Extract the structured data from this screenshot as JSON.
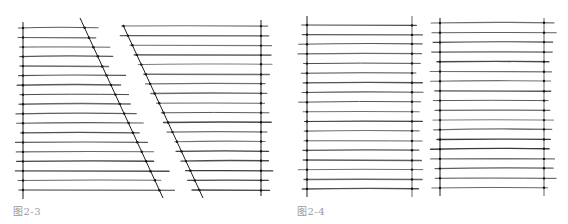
{
  "figures": [
    {
      "caption": "图2-3",
      "panels": [
        {
          "type": "left-vertical-right-diagonal",
          "vertical": {
            "x": 23,
            "y1": 22,
            "y2": 199
          },
          "diagonal": {
            "x1": 80,
            "y1": 18,
            "x2": 163,
            "y2": 198
          },
          "rows": {
            "y_start": 28,
            "y_end": 190,
            "count": 18
          },
          "overhang_left": 6,
          "overhang_right": 14
        },
        {
          "type": "left-diagonal-right-vertical",
          "vertical": {
            "x": 261,
            "y1": 20,
            "y2": 196
          },
          "diagonal": {
            "x1": 123,
            "y1": 25,
            "x2": 203,
            "y2": 198
          },
          "rows": {
            "y_start": 26,
            "y_end": 190,
            "count": 18
          },
          "overhang_left": 6,
          "overhang_right": 9
        }
      ]
    },
    {
      "caption": "图2-4",
      "panels": [
        {
          "type": "two-verticals",
          "left_x": 307,
          "right_x": 412,
          "y1": 16,
          "y2": 197,
          "rows": {
            "y_start": 25,
            "y_end": 189,
            "count": 18
          },
          "overhang_left": 7,
          "overhang_right": 9
        },
        {
          "type": "two-verticals",
          "left_x": 440,
          "right_x": 544,
          "y1": 18,
          "y2": 196,
          "rows": {
            "y_start": 23,
            "y_end": 188,
            "count": 18
          },
          "overhang_left": 8,
          "overhang_right": 9
        }
      ]
    }
  ],
  "colors": {
    "line": "#3a3a3a",
    "guide": "#1c1c1c",
    "dot": "#111111",
    "caption": "#9a9a9a"
  }
}
